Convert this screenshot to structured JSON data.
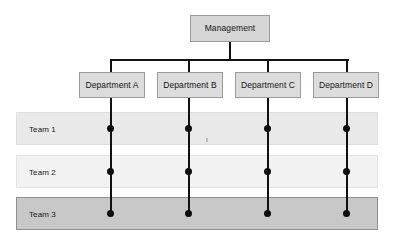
{
  "diagram": {
    "type": "matrix-organization-chart",
    "title": "",
    "root": {
      "label": "Management",
      "x": 190,
      "y": 15,
      "w": 80,
      "h": 27
    },
    "connector": {
      "trunk_x": 229,
      "trunk_top": 42,
      "trunk_bottom": 60,
      "bar_y": 60,
      "bar_left": 110,
      "bar_right": 348,
      "thickness": 2,
      "color": "#111111"
    },
    "departments": [
      {
        "label": "Department A",
        "x": 79,
        "y": 72,
        "w": 66,
        "h": 26,
        "center_x": 110
      },
      {
        "label": "Department B",
        "x": 157,
        "y": 72,
        "w": 66,
        "h": 26,
        "center_x": 189
      },
      {
        "label": "Department C",
        "x": 235,
        "y": 72,
        "w": 66,
        "h": 26,
        "center_x": 268
      },
      {
        "label": "Department D",
        "x": 313,
        "y": 72,
        "w": 66,
        "h": 26,
        "center_x": 347
      }
    ],
    "teams": [
      {
        "label": "Team 1",
        "y": 112,
        "h": 33,
        "style": "light-a",
        "dot_y": 128
      },
      {
        "label": "Team 2",
        "y": 155,
        "h": 33,
        "style": "light-b",
        "dot_y": 171
      },
      {
        "label": "Team 3",
        "y": 197,
        "h": 33,
        "style": "dark",
        "dot_y": 213
      }
    ],
    "rows_left": 16,
    "rows_width": 362,
    "colors": {
      "node_fill": "#dcdcdc",
      "node_border": "#9a9a9a",
      "row_light_a": "#e9e9e9",
      "row_light_b": "#f2f2f2",
      "row_dark": "#c8c8c8",
      "line": "#111111",
      "dot": "#0d0d0d",
      "background": "#ffffff"
    },
    "intersections": [
      {
        "department": "Department A",
        "teams": [
          "Team 1",
          "Team 2",
          "Team 3"
        ]
      },
      {
        "department": "Department B",
        "teams": [
          "Team 1",
          "Team 2",
          "Team 3"
        ]
      },
      {
        "department": "Department C",
        "teams": [
          "Team 1",
          "Team 2",
          "Team 3"
        ]
      },
      {
        "department": "Department D",
        "teams": [
          "Team 1",
          "Team 2",
          "Team 3"
        ]
      }
    ]
  }
}
